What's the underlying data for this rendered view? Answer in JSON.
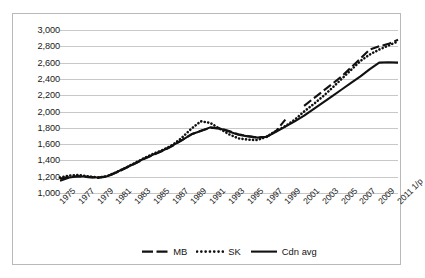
{
  "chart_data": {
    "type": "line",
    "title": "",
    "subtitle": "",
    "xlabel": "",
    "ylabel": "",
    "ylim": [
      1000,
      3000
    ],
    "ytick_step": 200,
    "yticks": [
      "1,000",
      "1,200",
      "1,400",
      "1,600",
      "1,800",
      "2,000",
      "2,200",
      "2,400",
      "2,600",
      "2,800",
      "3,000"
    ],
    "grid": true,
    "legend_position": "bottom",
    "x": [
      1975,
      1976,
      1977,
      1978,
      1979,
      1980,
      1981,
      1982,
      1983,
      1984,
      1985,
      1986,
      1987,
      1988,
      1989,
      1990,
      1991,
      1992,
      1993,
      1994,
      1995,
      1996,
      1997,
      1998,
      1999,
      2000,
      2001,
      2002,
      2003,
      2004,
      2005,
      2006,
      2007,
      2008,
      2009,
      2010,
      2011
    ],
    "categories": [
      "1975",
      "1976",
      "1977",
      "1978",
      "1979",
      "1980",
      "1981",
      "1982",
      "1983",
      "1984",
      "1985",
      "1986",
      "1987",
      "1988",
      "1989",
      "1990",
      "1991",
      "1992",
      "1993",
      "1994",
      "1995",
      "1996",
      "1997",
      "1998",
      "1999",
      "2000",
      "2001",
      "2002",
      "2003",
      "2004",
      "2005",
      "2006",
      "2007",
      "2008",
      "2009",
      "2010",
      "2011 1/p"
    ],
    "tick_labels": [
      "1975",
      "1977",
      "1979",
      "1981",
      "1983",
      "1985",
      "1987",
      "1989",
      "1991",
      "1993",
      "1995",
      "1997",
      "1999",
      "2001",
      "2003",
      "2005",
      "2007",
      "2009",
      "2011 1/p"
    ],
    "series": [
      {
        "name": "MB",
        "style": "dashed",
        "color": "#111111",
        "values": [
          1175,
          1200,
          1205,
          1195,
          1185,
          1200,
          1250,
          1305,
          1360,
          1420,
          1470,
          1520,
          1580,
          1650,
          1720,
          1765,
          1800,
          1795,
          1760,
          1720,
          1700,
          1680,
          1690,
          1760,
          1900,
          null,
          2070,
          2160,
          2250,
          2340,
          2430,
          2540,
          2650,
          2760,
          2800,
          2830,
          2880
        ]
      },
      {
        "name": "SK",
        "style": "dotted",
        "color": "#111111",
        "values": [
          1190,
          1215,
          1220,
          1205,
          1190,
          1205,
          1255,
          1310,
          1370,
          1430,
          1485,
          1530,
          1590,
          1680,
          1790,
          1880,
          1860,
          1790,
          1720,
          1670,
          1655,
          1650,
          1690,
          1760,
          1820,
          1900,
          2000,
          2090,
          2185,
          2290,
          2400,
          2510,
          2620,
          2700,
          2760,
          2810,
          2860
        ]
      },
      {
        "name": "Cdn avg",
        "style": "solid",
        "color": "#111111",
        "values": [
          1150,
          1190,
          1205,
          1200,
          1190,
          1205,
          1255,
          1310,
          1365,
          1425,
          1475,
          1525,
          1585,
          1650,
          1720,
          1760,
          1805,
          1790,
          1755,
          1715,
          1695,
          1680,
          1690,
          1750,
          1815,
          1880,
          1950,
          2030,
          2110,
          2190,
          2270,
          2350,
          2430,
          2520,
          2600,
          2605,
          2600
        ]
      }
    ]
  },
  "legend": {
    "items": [
      {
        "label": "MB",
        "style": "dashed"
      },
      {
        "label": "SK",
        "style": "dotted"
      },
      {
        "label": "Cdn avg",
        "style": "solid"
      }
    ]
  }
}
